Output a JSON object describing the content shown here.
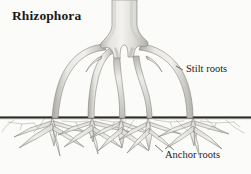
{
  "figure": {
    "title": "Rhizophora",
    "background_color": "#fbfbf9",
    "ink_color": "#2b2b2b",
    "root_fill_light": "#f2f1ee",
    "root_fill_mid": "#d7d6d2",
    "root_fill_dark": "#a9a8a4",
    "ground_line_color": "#2e2c28",
    "labels": {
      "stilt_roots": "Stilt roots",
      "anchor_roots": "Anchor roots"
    },
    "parts": [
      {
        "name": "trunk",
        "label": "trunk"
      },
      {
        "name": "stilt-roots",
        "label": "Stilt roots",
        "count": 5
      },
      {
        "name": "ground-line",
        "label": "ground line"
      },
      {
        "name": "anchor-roots",
        "label": "Anchor roots",
        "count": 6
      }
    ],
    "geometry": {
      "width": 251,
      "height": 174,
      "ground_y": 118,
      "trunk_top_x": 112,
      "trunk_top_width": 24,
      "trunk_flare_y": 34
    }
  }
}
